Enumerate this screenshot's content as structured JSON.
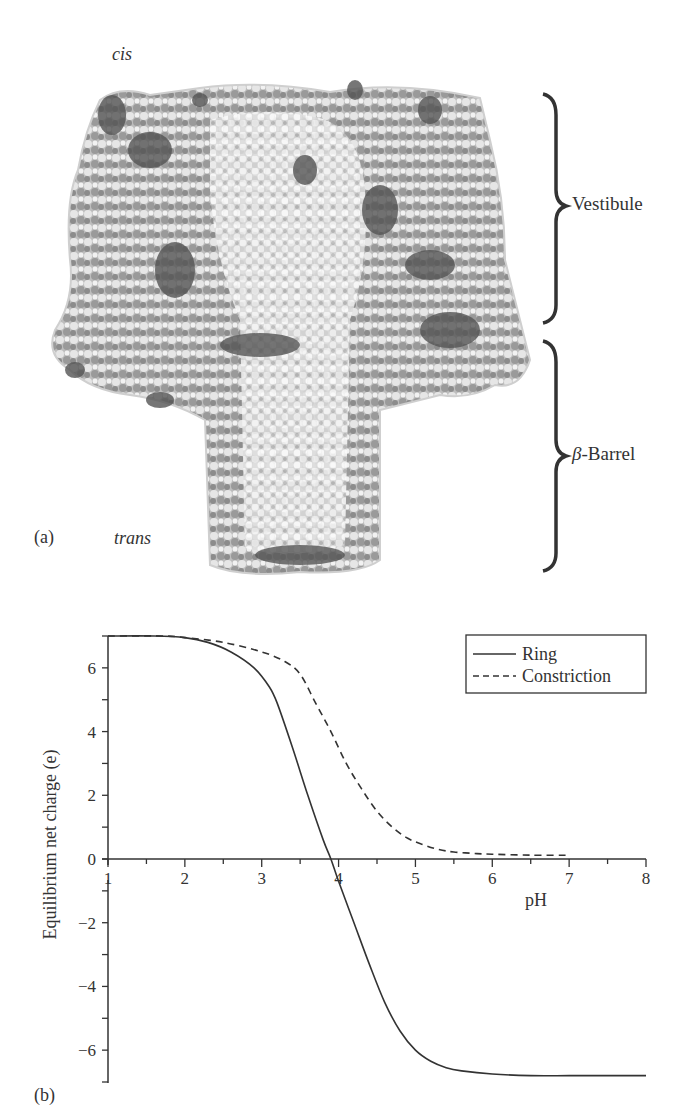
{
  "figure": {
    "panel_a": {
      "label": "(a)",
      "cis_label": "cis",
      "trans_label": "trans",
      "regions": [
        {
          "name": "Vestibule",
          "label": "Vestibule"
        },
        {
          "name": "beta-barrel",
          "label_prefix": "β",
          "label_suffix": "-Barrel"
        }
      ],
      "image_description": "Space-filling molecular model of a pore protein (grayscale)"
    },
    "panel_b": {
      "label": "(b)"
    }
  },
  "chart_data": {
    "type": "line",
    "title": "",
    "xlabel": "pH",
    "ylabel": "Equilibrium net charge (e)",
    "xlim": [
      1,
      8
    ],
    "ylim": [
      -7,
      7
    ],
    "x_ticks": [
      1,
      2,
      3,
      4,
      5,
      6,
      7,
      8
    ],
    "y_ticks": [
      -6,
      -4,
      -2,
      0,
      2,
      4,
      6
    ],
    "y_tick_labels": [
      "−6",
      "−4",
      "−2",
      "0",
      "2",
      "4",
      "6"
    ],
    "grid": false,
    "legend_position": "upper right",
    "series": [
      {
        "name": "Ring",
        "style": "solid",
        "x": [
          1.0,
          1.6,
          2.0,
          2.3,
          2.6,
          2.9,
          3.1,
          3.2,
          3.4,
          3.6,
          3.8,
          3.9,
          4.0,
          4.2,
          4.4,
          4.6,
          4.8,
          5.0,
          5.2,
          5.4,
          5.6,
          6.0,
          6.5,
          7.0,
          7.5,
          8.0
        ],
        "y": [
          7.0,
          7.0,
          6.95,
          6.8,
          6.5,
          6.0,
          5.4,
          4.9,
          3.5,
          2.0,
          0.6,
          0.0,
          -0.7,
          -2.0,
          -3.3,
          -4.5,
          -5.4,
          -6.0,
          -6.35,
          -6.55,
          -6.65,
          -6.75,
          -6.8,
          -6.8,
          -6.8,
          -6.8
        ]
      },
      {
        "name": "Constriction",
        "style": "dashed",
        "x": [
          1.0,
          1.7,
          2.0,
          2.5,
          3.0,
          3.3,
          3.5,
          3.7,
          3.9,
          4.1,
          4.3,
          4.5,
          4.7,
          4.9,
          5.1,
          5.3,
          5.5,
          5.8,
          6.0,
          6.5,
          7.0
        ],
        "y": [
          7.0,
          7.0,
          6.95,
          6.8,
          6.5,
          6.2,
          5.8,
          4.9,
          4.0,
          3.0,
          2.2,
          1.5,
          1.0,
          0.65,
          0.45,
          0.3,
          0.22,
          0.17,
          0.15,
          0.12,
          0.12
        ]
      }
    ]
  }
}
